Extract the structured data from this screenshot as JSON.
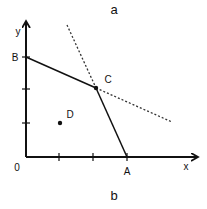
{
  "title_top": "a",
  "title_bottom": "b",
  "axes": {
    "x_label": "x",
    "y_label": "y",
    "origin_label": "0"
  },
  "points": {
    "A": {
      "label": "A"
    },
    "B": {
      "label": "B"
    },
    "C": {
      "label": "C"
    },
    "D": {
      "label": "D"
    }
  },
  "colors": {
    "ink": "#111111",
    "background": "#ffffff"
  }
}
